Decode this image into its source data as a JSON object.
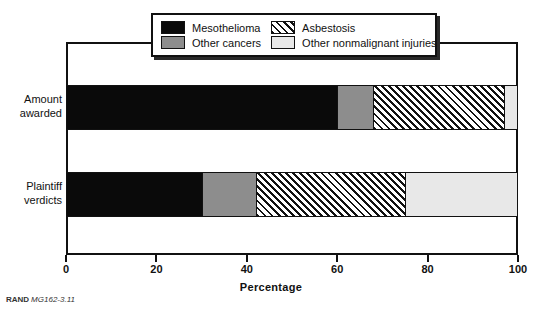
{
  "figure": {
    "source_note_brand": "RAND",
    "source_note_code": "MG162-3.11"
  },
  "legend": {
    "position": "top-center",
    "items": [
      {
        "label": "Mesothelioma",
        "swatch": "solid-black-swatch",
        "color": "#0a0a0a"
      },
      {
        "label": "Asbestosis",
        "swatch": "diagonal-hatch-swatch",
        "color": "#ffffff"
      },
      {
        "label": "Other cancers",
        "swatch": "solid-gray-swatch",
        "color": "#8d8d8d"
      },
      {
        "label": "Other nonmalignant injuries",
        "swatch": "solid-light-gray-swatch",
        "color": "#e8e8e8"
      }
    ]
  },
  "chart_data": {
    "type": "bar",
    "orientation": "horizontal",
    "stacked": true,
    "title": "",
    "xlabel": "Percentage",
    "ylabel": "",
    "xlim": [
      0,
      100
    ],
    "xticks": [
      0,
      20,
      40,
      60,
      80,
      100
    ],
    "grid": false,
    "legend_position": "top-center",
    "categories": [
      "Amount awarded",
      "Plaintiff verdicts"
    ],
    "series": [
      {
        "name": "Mesothelioma",
        "values": [
          60,
          30
        ]
      },
      {
        "name": "Other cancers",
        "values": [
          8,
          12
        ]
      },
      {
        "name": "Asbestosis",
        "values": [
          29,
          33
        ]
      },
      {
        "name": "Other nonmalignant injuries",
        "values": [
          3,
          25
        ]
      }
    ]
  },
  "axis": {
    "tick_labels": [
      "0",
      "20",
      "40",
      "60",
      "80",
      "100"
    ],
    "title": "Percentage"
  },
  "bars": [
    {
      "category_line1": "Amount",
      "category_line2": "awarded",
      "segments": [
        {
          "name": "Mesothelioma",
          "value": 60,
          "style": "meso"
        },
        {
          "name": "Other cancers",
          "value": 8,
          "style": "other-cancer"
        },
        {
          "name": "Asbestosis",
          "value": 29,
          "style": "asbestosis"
        },
        {
          "name": "Other nonmalignant injuries",
          "value": 3,
          "style": "other-nonmal"
        }
      ]
    },
    {
      "category_line1": "Plaintiff",
      "category_line2": "verdicts",
      "segments": [
        {
          "name": "Mesothelioma",
          "value": 30,
          "style": "meso"
        },
        {
          "name": "Other cancers",
          "value": 12,
          "style": "other-cancer"
        },
        {
          "name": "Asbestosis",
          "value": 33,
          "style": "asbestosis"
        },
        {
          "name": "Other nonmalignant injuries",
          "value": 25,
          "style": "other-nonmal"
        }
      ]
    }
  ]
}
